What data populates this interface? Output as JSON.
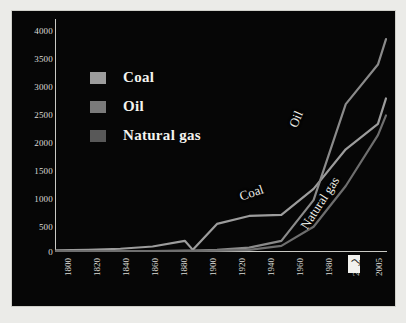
{
  "chart_data": {
    "type": "line",
    "title": "",
    "subtitle": "",
    "xlabel": "",
    "ylabel": "",
    "xlim": [
      1800,
      2005
    ],
    "ylim": [
      0,
      4000
    ],
    "grid": false,
    "legend_position": "upper-left-inside",
    "background": "#060606",
    "x_tick_labels": [
      "1800",
      "1820",
      "1840",
      "1860",
      "1880",
      "1900",
      "1920",
      "1940",
      "1960",
      "1980",
      "2000",
      "2005"
    ],
    "y_tick_labels": [
      "0",
      "500",
      "1000",
      "1500",
      "2000",
      "2500",
      "3000",
      "3500",
      "4000"
    ],
    "x": [
      1800,
      1820,
      1840,
      1860,
      1880,
      1885,
      1900,
      1920,
      1940,
      1960,
      1980,
      2000,
      2005
    ],
    "series": [
      {
        "name": "Coal",
        "color": "#9c9c9c",
        "inline_label": "Coal",
        "values": [
          10,
          20,
          40,
          80,
          180,
          20,
          480,
          620,
          640,
          1100,
          1800,
          2250,
          2700
        ]
      },
      {
        "name": "Oil",
        "color": "#7a7a7a",
        "inline_label": "Oil",
        "values": [
          0,
          0,
          0,
          0,
          5,
          5,
          20,
          60,
          180,
          900,
          2600,
          3300,
          3750
        ]
      },
      {
        "name": "Natural gas",
        "color": "#585858",
        "inline_label": "Natural gas",
        "values": [
          0,
          0,
          0,
          0,
          0,
          0,
          5,
          20,
          90,
          430,
          1150,
          2050,
          2400
        ]
      }
    ]
  },
  "legend": {
    "items": [
      {
        "label": "Coal",
        "color": "#9c9c9c"
      },
      {
        "label": "Oil",
        "color": "#7a7a7a"
      },
      {
        "label": "Natural gas",
        "color": "#585858"
      }
    ]
  },
  "axes": {
    "y_ticks": [
      "4000",
      "3500",
      "3000",
      "2500",
      "2000",
      "1500",
      "1000",
      "500",
      "0"
    ],
    "x_ticks": [
      "1800",
      "1820",
      "1840",
      "1860",
      "1880",
      "1900",
      "1920",
      "1940",
      "1960",
      "1980",
      "2000",
      "2005"
    ]
  },
  "artifact": {
    "mark": "⤳"
  }
}
